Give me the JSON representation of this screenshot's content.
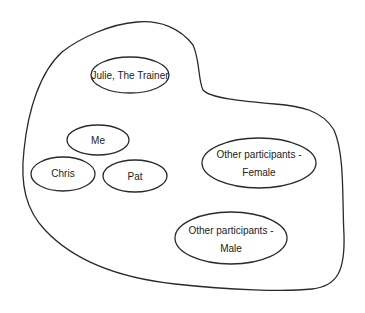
{
  "diagram": {
    "type": "venn-grouping",
    "container": {
      "label": ""
    },
    "nodes": [
      {
        "id": "julie",
        "label": "Julie, The Trainer",
        "lines": [
          "Julie, The Trainer"
        ]
      },
      {
        "id": "me",
        "label": "Me",
        "lines": [
          "Me"
        ]
      },
      {
        "id": "chris",
        "label": "Chris",
        "lines": [
          "Chris"
        ]
      },
      {
        "id": "pat",
        "label": "Pat",
        "lines": [
          "Pat"
        ]
      },
      {
        "id": "female",
        "label": "Other participants - Female",
        "lines": [
          "Other participants -",
          "Female"
        ]
      },
      {
        "id": "male",
        "label": "Other participants - Male",
        "lines": [
          "Other participants -",
          "Male"
        ]
      }
    ]
  },
  "colors": {
    "stroke": "#2a2a2a",
    "background": "#ffffff",
    "text": "#222222"
  }
}
